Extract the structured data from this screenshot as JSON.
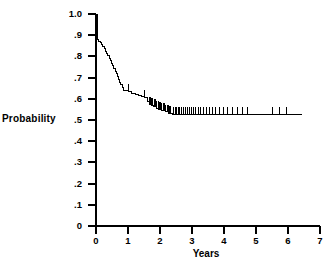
{
  "figure": {
    "background": "#ffffff",
    "ink": "#000000"
  },
  "chart_data": {
    "type": "line",
    "subtype": "kaplan-meier-survival-step",
    "title": "",
    "xlabel": "Years",
    "ylabel": "Probability",
    "xlim": [
      0,
      7
    ],
    "ylim": [
      0,
      1.0
    ],
    "grid": false,
    "legend": null,
    "xticks": [
      0,
      1,
      2,
      3,
      4,
      5,
      6,
      7
    ],
    "xticklabels": [
      "0",
      "1",
      "2",
      "3",
      "4",
      "5",
      "6",
      "7"
    ],
    "yticks": [
      0,
      0.1,
      0.2,
      0.3,
      0.4,
      0.5,
      0.6,
      0.7,
      0.8,
      0.9,
      1.0
    ],
    "yticklabels": [
      "0",
      ".1",
      ".2",
      ".3",
      ".4",
      ".5",
      ".6",
      ".7",
      ".8",
      ".9",
      "1.0"
    ],
    "line_color": "#000000",
    "line_width": 1.0,
    "series": [
      {
        "name": "Survival probability",
        "step": "post",
        "x": [
          0.0,
          0.06,
          0.09,
          0.13,
          0.17,
          0.21,
          0.25,
          0.29,
          0.33,
          0.37,
          0.41,
          0.45,
          0.49,
          0.53,
          0.56,
          0.6,
          0.64,
          0.67,
          0.7,
          0.74,
          0.78,
          0.82,
          0.86,
          0.92,
          1.0,
          1.12,
          1.22,
          1.32,
          1.42,
          1.52,
          1.6,
          1.66,
          1.72,
          1.8,
          1.88,
          1.96,
          2.06,
          2.16,
          2.28,
          2.4,
          6.45
        ],
        "y": [
          1.0,
          0.88,
          0.872,
          0.864,
          0.855,
          0.845,
          0.835,
          0.824,
          0.814,
          0.803,
          0.792,
          0.78,
          0.768,
          0.756,
          0.744,
          0.731,
          0.718,
          0.705,
          0.692,
          0.679,
          0.666,
          0.652,
          0.64,
          0.638,
          0.636,
          0.624,
          0.62,
          0.616,
          0.612,
          0.607,
          0.585,
          0.575,
          0.568,
          0.562,
          0.556,
          0.55,
          0.544,
          0.538,
          0.532,
          0.527,
          0.527
        ]
      }
    ],
    "censor_marks": {
      "symbol": "vertical-tick",
      "tick_height_prob": 0.035,
      "times": [
        1.0,
        1.52,
        1.66,
        1.7,
        1.74,
        1.78,
        1.82,
        1.86,
        1.9,
        1.94,
        1.98,
        2.02,
        2.06,
        2.1,
        2.14,
        2.18,
        2.22,
        2.26,
        2.3,
        2.34,
        2.42,
        2.47,
        2.52,
        2.57,
        2.62,
        2.67,
        2.73,
        2.79,
        2.85,
        2.91,
        2.98,
        3.05,
        3.12,
        3.2,
        3.28,
        3.36,
        3.45,
        3.54,
        3.64,
        3.74,
        3.86,
        3.98,
        4.12,
        4.26,
        4.42,
        4.58,
        4.72,
        5.52,
        5.74,
        5.96
      ]
    }
  },
  "axis_labels": {
    "y": "Probability",
    "x": "Years"
  }
}
